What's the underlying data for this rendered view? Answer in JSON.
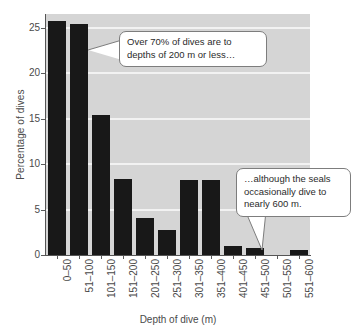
{
  "chart_data": {
    "type": "bar",
    "title": "",
    "subtitle": "",
    "xlabel": "Depth of dive (m)",
    "ylabel": "Percentage of dives",
    "categories": [
      "0–50",
      "51–100",
      "101–150",
      "151–200",
      "201–250",
      "251–300",
      "301–350",
      "351–400",
      "401–450",
      "451–500",
      "501–550",
      "551–600"
    ],
    "values": [
      25.7,
      25.4,
      15.4,
      8.4,
      4.1,
      2.8,
      8.3,
      8.3,
      1.0,
      0.8,
      0.0,
      0.6
    ],
    "ylim": [
      0,
      26.5
    ],
    "yticks": [
      0,
      5,
      10,
      15,
      20,
      25
    ],
    "ytick_labels": [
      "0",
      "5",
      "10",
      "15",
      "20",
      "25"
    ],
    "grid": "horizontal",
    "legend": "none",
    "bar_color": "#181818",
    "plot_background": "#d5d5d5",
    "gridline_color": "#f2f2f2",
    "annotations": [
      {
        "id": "callout-1",
        "lines": [
          "Over 70% of dives are to",
          "depths of 200 m or less…"
        ],
        "points_to": "101–150"
      },
      {
        "id": "callout-2",
        "lines": [
          "…although the seals",
          "occasionally dive to",
          "nearly 600 m."
        ],
        "points_to": "551–600"
      }
    ]
  }
}
